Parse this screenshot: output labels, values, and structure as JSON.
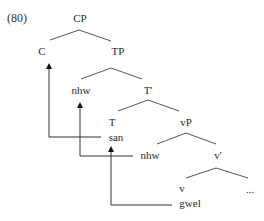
{
  "example_number": "(80)",
  "nodes": {
    "cp": {
      "label": "CP",
      "x": 80,
      "y": 12
    },
    "c": {
      "label": "C",
      "x": 42,
      "y": 45
    },
    "tp": {
      "label": "TP",
      "x": 118,
      "y": 45
    },
    "spec_tp": {
      "label": "nhw",
      "x": 81,
      "y": 84
    },
    "t_bar": {
      "label": "T'",
      "x": 148,
      "y": 84
    },
    "t": {
      "label": "T",
      "x": 112,
      "y": 116
    },
    "t_word": {
      "label": "san",
      "x": 116,
      "y": 131
    },
    "vp": {
      "label": "vP",
      "x": 186,
      "y": 116
    },
    "spec_vp": {
      "label": "nhw",
      "x": 150,
      "y": 149
    },
    "v_bar": {
      "label": "v'",
      "x": 218,
      "y": 149
    },
    "v": {
      "label": "v",
      "x": 182,
      "y": 182
    },
    "v_word": {
      "label": "gwel",
      "x": 190,
      "y": 197
    },
    "complement": {
      "label": "...",
      "x": 250,
      "y": 183
    }
  },
  "branches": [
    {
      "from": [
        50,
        40
      ],
      "apex": [
        79,
        30
      ],
      "to": [
        111,
        41
      ]
    },
    {
      "from": [
        81,
        79
      ],
      "apex": [
        111,
        68
      ],
      "to": [
        142,
        79
      ]
    },
    {
      "from": [
        118,
        111
      ],
      "apex": [
        148,
        100
      ],
      "to": [
        179,
        111
      ]
    },
    {
      "from": [
        157,
        144
      ],
      "apex": [
        186,
        133
      ],
      "to": [
        216,
        144
      ]
    },
    {
      "from": [
        186,
        178
      ],
      "apex": [
        216,
        168
      ],
      "to": [
        248,
        178
      ]
    }
  ],
  "movement_arrows": [
    {
      "name": "san-to-C",
      "x": 49,
      "top": 63,
      "bottom": 137,
      "end_x": 101
    },
    {
      "name": "nhw-to-SpecTP",
      "x": 80,
      "top": 102,
      "bottom": 156,
      "end_x": 133
    },
    {
      "name": "gwel-to-T",
      "x": 111,
      "top": 146,
      "bottom": 205,
      "end_x": 172
    }
  ],
  "colors": {
    "line": "#555555",
    "arrow": "#333333",
    "text": "#2a2a2a"
  }
}
